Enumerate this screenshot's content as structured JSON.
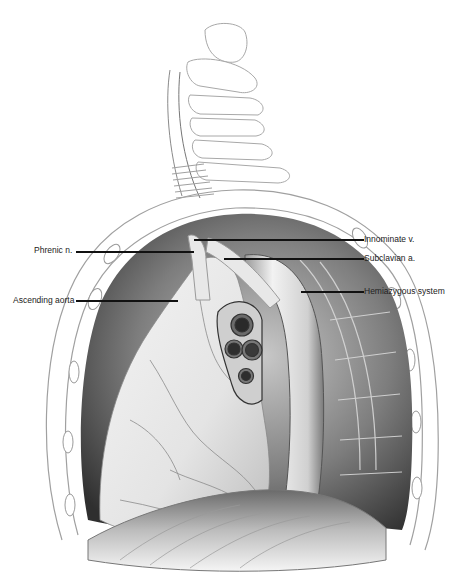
{
  "figure": {
    "colors": {
      "background": "#ffffff",
      "outline": "#9a9a9a",
      "cavity_dark": "#3a3a3a",
      "cavity_mid": "#8c8c8c",
      "tissue_light": "#e6e6e6",
      "leader": "#111111",
      "label_text": "#222222"
    }
  },
  "labels": {
    "left": [
      {
        "id": "phrenic",
        "text": "Phrenic n."
      },
      {
        "id": "ascending-aorta",
        "text": "Ascending aorta"
      }
    ],
    "right": [
      {
        "id": "innominate",
        "text": "Innominate v."
      },
      {
        "id": "subclavian",
        "text": "Subclavian a."
      },
      {
        "id": "hemiazygous",
        "text": "Hemiazygous system"
      }
    ]
  }
}
